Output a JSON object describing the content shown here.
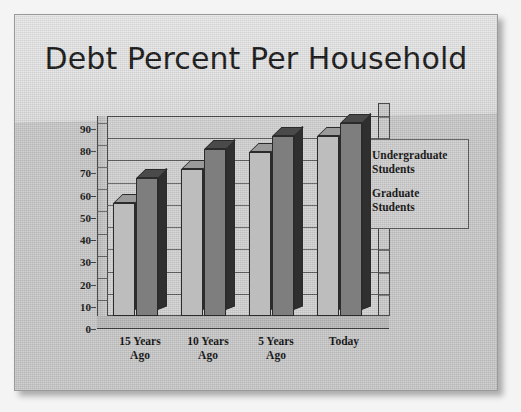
{
  "slide": {
    "title": "Debt Percent Per Household",
    "background_color": "#c9c9c9",
    "title_band_color": "#e6e6e6"
  },
  "chart_data": {
    "type": "bar",
    "title": "Debt Percent Per Household",
    "xlabel": "",
    "ylabel": "",
    "ylim": [
      0,
      90
    ],
    "ytick_step": 10,
    "yticks": [
      "90",
      "80",
      "70",
      "60",
      "50",
      "40",
      "30",
      "20",
      "10",
      "0"
    ],
    "grid": true,
    "three_d": true,
    "legend_position": "right",
    "categories": [
      "15 Years\nAgo",
      "10 Years\nAgo",
      "5 Years\nAgo",
      "Today"
    ],
    "category_lines": [
      [
        "15 Years",
        "Ago"
      ],
      [
        "10 Years",
        "Ago"
      ],
      [
        "5 Years",
        "Ago"
      ],
      [
        "Today",
        ""
      ]
    ],
    "series": [
      {
        "name": "Undergraduate Students",
        "name_lines": [
          "Undergraduate",
          "Students"
        ],
        "color": "#bdbdbd",
        "values": [
          51,
          66,
          74,
          81
        ]
      },
      {
        "name": "Graduate Students",
        "name_lines": [
          "Graduate",
          "Students"
        ],
        "color": "#7e7e7e",
        "values": [
          62,
          75,
          81,
          87
        ]
      }
    ]
  },
  "legend": {
    "items": [
      {
        "label_line1": "Undergraduate",
        "label_line2": "Students",
        "color": "#bdbdbd"
      },
      {
        "label_line1": "Graduate",
        "label_line2": "Students",
        "color": "#7e7e7e"
      }
    ]
  }
}
